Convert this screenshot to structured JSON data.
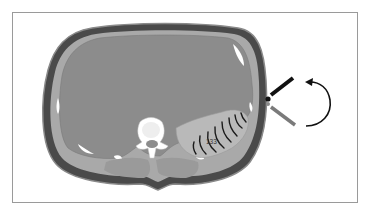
{
  "figure": {
    "type": "axial cross-section of upper abdomen with ultrasound probe",
    "labels": {
      "spleen_number": "133"
    },
    "colors": {
      "skin_outer": "#4a4a4a",
      "skin_rim": "#8a8a8a",
      "organ_gray": "#8c8c8c",
      "spleen": "#b9b9b9",
      "vertebra": "#ffffff",
      "muscle": "#9a9a9a",
      "probe_active": "#111111",
      "probe_ghost": "#7a7a7a",
      "frame_border": "#9a9a9a"
    },
    "annotations": {
      "rotation_arrow": "counter-clockwise curved arrow indicating probe rotation",
      "probe_positions": [
        "active (black)",
        "alternate (gray)"
      ],
      "acoustic_arcs": 8
    }
  }
}
